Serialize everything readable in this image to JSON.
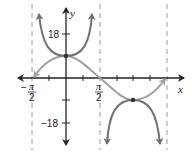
{
  "diagram": {
    "title": "",
    "axes": {
      "x_label": "x",
      "y_label": "y",
      "y_ticks": [
        {
          "value": 18,
          "label": "18"
        },
        {
          "value": 9,
          "label": ""
        },
        {
          "value": -9,
          "label": ""
        },
        {
          "value": -18,
          "label": "−18"
        }
      ],
      "x_tick_labels": [
        {
          "value": "-pi/2",
          "sign": "−",
          "numerator": "π",
          "denominator": "2"
        },
        {
          "value": "pi/2",
          "sign": "",
          "numerator": "π",
          "denominator": "2"
        }
      ]
    },
    "curves": [
      {
        "name": "cosine",
        "equation": "y = 9 cos x",
        "color": "#a0a0a0",
        "domain": "[-pi/2, 3pi/2]"
      },
      {
        "name": "secant",
        "equation": "y = 9 sec x",
        "color": "#707070"
      }
    ],
    "asymptotes": [
      "-pi/2",
      "pi/2",
      "3pi/2"
    ],
    "points": [
      {
        "x": "0",
        "y": "9"
      },
      {
        "x": "pi",
        "y": "-9"
      }
    ],
    "colors": {
      "axis": "#222222",
      "asymptote": "#9a9a9a",
      "cos_curve": "#a0a0a0",
      "sec_curve": "#707070"
    }
  }
}
